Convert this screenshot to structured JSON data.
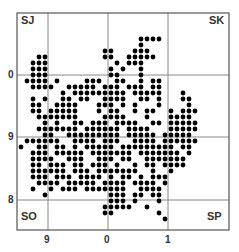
{
  "map": {
    "frame": {
      "x": 17,
      "y": 13,
      "w": 212,
      "h": 217,
      "color": "#555555"
    },
    "grid_color": "#888888",
    "boundary_color": "#aaaaaa",
    "dot_color": "#000000",
    "vertical_lines": [
      {
        "x": 48,
        "label": "9"
      },
      {
        "x": 108,
        "label": "0"
      },
      {
        "x": 168,
        "label": "1"
      }
    ],
    "horizontal_lines": [
      {
        "y": 75,
        "label": "0"
      },
      {
        "y": 137,
        "label": "9"
      },
      {
        "y": 200,
        "label": "8"
      }
    ],
    "corner_labels": {
      "top_left": "SJ",
      "top_right": "SK",
      "bottom_left": "SO",
      "bottom_right": "SP"
    },
    "dot_grid": {
      "origin_x": 21,
      "origin_y": 21,
      "step": 6,
      "rows": [
        "",
        "",
        "..........................",
        "....................####..",
        "....................#.....",
        "..............##...###....",
        "...##.........##..#####...",
        "..###...........#.###....",
        "..###..........#.#..#.....",
        "..###..........##...#.....",
        ".####.#....###..##..#.##..",
        "..####..#####.###.###.##..",
        ".......#.#########.#####...#",
        "..#.#..##.##..####..##.#...##",
        "..##..####...###.#.#...#....#",
        "..##.#####...#.##..#.##..#.###",
        "...#######....####...#...####.",
        "....#.#..##.###.####..##.#####",
        "...#######.######.####...#####",
        "....##..#########.#####.#####.",
        ".######..####.###..####.######",
        "#..##.##.#.#####.#########.##",
        "..###.#####.#######.#######.#",
        "..####..###..###.##..#######",
        "..##.###.##.###.#..#.##.####",
        "..######.###.#######..#..#..",
        "..###.###.####.#.##.#.###...",
        "...####.#####.####.####.#...",
        "..#..#.###.#######..####....",
        "....#..........###.##.##....",
        "...............###.#...#....",
        "..............#####..#......",
        "..............##.......#....",
        "........................#...",
        ""
      ]
    }
  }
}
